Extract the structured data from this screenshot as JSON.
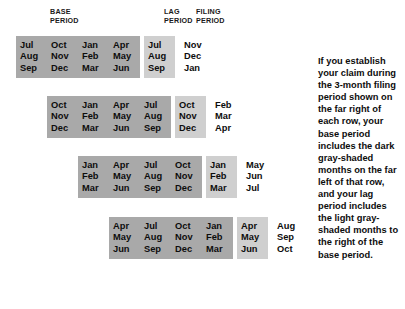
{
  "headers": {
    "base": "BASE\nPERIOD",
    "lag": "LAG\nPERIOD",
    "filing": "FILING\nPERIOD"
  },
  "colors": {
    "base_shade": "#a9a9a9",
    "lag_shade": "#cfcfcf",
    "filing_shade": "#ffffff",
    "text": "#0d0d0d",
    "background": "#ffffff"
  },
  "rows": [
    {
      "base": [
        [
          "Jul",
          "Aug",
          "Sep"
        ],
        [
          "Oct",
          "Nov",
          "Dec"
        ],
        [
          "Jan",
          "Feb",
          "Mar"
        ],
        [
          "Apr",
          "May",
          "Jun"
        ]
      ],
      "lag": [
        [
          "Jul",
          "Aug",
          "Sep"
        ]
      ],
      "filing": [
        [
          "Nov",
          "Dec",
          "Jan"
        ]
      ]
    },
    {
      "base": [
        [
          "Oct",
          "Nov",
          "Dec"
        ],
        [
          "Jan",
          "Feb",
          "Mar"
        ],
        [
          "Apr",
          "May",
          "Jun"
        ],
        [
          "Jul",
          "Aug",
          "Sep"
        ]
      ],
      "lag": [
        [
          "Oct",
          "Nov",
          "Dec"
        ]
      ],
      "filing": [
        [
          "Feb",
          "Mar",
          "Apr"
        ]
      ]
    },
    {
      "base": [
        [
          "Jan",
          "Feb",
          "Mar"
        ],
        [
          "Apr",
          "May",
          "Jun"
        ],
        [
          "Jul",
          "Aug",
          "Sep"
        ],
        [
          "Oct",
          "Nov",
          "Dec"
        ]
      ],
      "lag": [
        [
          "Jan",
          "Feb",
          "Mar"
        ]
      ],
      "filing": [
        [
          "May",
          "Jun",
          "Jul"
        ]
      ]
    },
    {
      "base": [
        [
          "Apr",
          "May",
          "Jun"
        ],
        [
          "Jul",
          "Aug",
          "Sep"
        ],
        [
          "Oct",
          "Nov",
          "Dec"
        ],
        [
          "Jan",
          "Feb",
          "Mar"
        ]
      ],
      "lag": [
        [
          "Apr",
          "May",
          "Jun"
        ]
      ],
      "filing": [
        [
          "Aug",
          "Sep",
          "Oct"
        ]
      ]
    }
  ],
  "note": "If you establish your claim during the 3-month filing period shown on the far right of each row, your base period includes the dark gray-shaded months on the far left of that row, and your lag period includes the light gray-shaded months to the right of the base period."
}
